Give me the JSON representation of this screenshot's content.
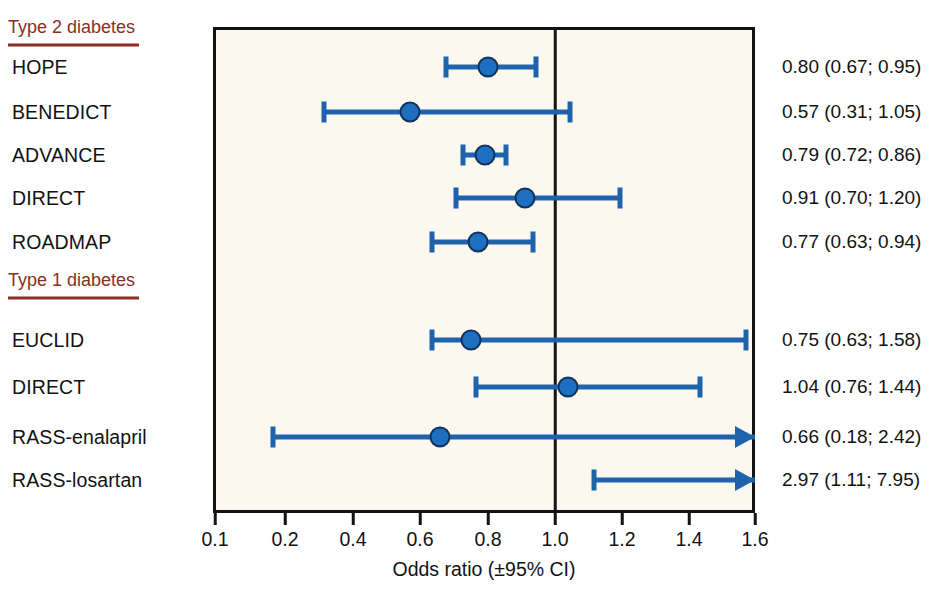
{
  "chart_data": {
    "type": "forest",
    "title": "",
    "xlabel": "Odds ratio (±95% CI)",
    "ylabel": "",
    "xlim": [
      0.1,
      1.6
    ],
    "reference_line": 1.0,
    "grid": false,
    "axis_note": "first segment 0.1 to 0.2 is compressed; remainder linear in 0.2 steps",
    "ticks": [
      {
        "value": 0.1,
        "label": "0.1",
        "px": 215
      },
      {
        "value": 0.2,
        "label": "0.2",
        "px": 285
      },
      {
        "value": 0.4,
        "label": "0.4",
        "px": 353
      },
      {
        "value": 0.6,
        "label": "0.6",
        "px": 420
      },
      {
        "value": 0.8,
        "label": "0.8",
        "px": 488
      },
      {
        "value": 1.0,
        "label": "1.0",
        "px": 555
      },
      {
        "value": 1.2,
        "label": "1.2",
        "px": 622
      },
      {
        "value": 1.4,
        "label": "1.4",
        "px": 689
      },
      {
        "value": 1.6,
        "label": "1.6",
        "px": 755
      }
    ],
    "sections": [
      {
        "label": "Type 2 diabetes",
        "y": 28,
        "rows": [
          {
            "study": "HOPE",
            "y": 67,
            "estimate": 0.8,
            "ci_low": 0.67,
            "ci_high": 0.95,
            "text": "0.80 (0.67; 0.95)",
            "arrow_right": false,
            "show_marker": true
          },
          {
            "study": "BENEDICT",
            "y": 112,
            "estimate": 0.57,
            "ci_low": 0.31,
            "ci_high": 1.05,
            "text": "0.57 (0.31; 1.05)",
            "arrow_right": false,
            "show_marker": true
          },
          {
            "study": "ADVANCE",
            "y": 155,
            "estimate": 0.79,
            "ci_low": 0.72,
            "ci_high": 0.86,
            "text": "0.79 (0.72; 0.86)",
            "arrow_right": false,
            "show_marker": true
          },
          {
            "study": "DIRECT",
            "y": 198,
            "estimate": 0.91,
            "ci_low": 0.7,
            "ci_high": 1.2,
            "text": "0.91 (0.70; 1.20)",
            "arrow_right": false,
            "show_marker": true
          },
          {
            "study": "ROADMAP",
            "y": 242,
            "estimate": 0.77,
            "ci_low": 0.63,
            "ci_high": 0.94,
            "text": "0.77 (0.63; 0.94)",
            "arrow_right": false,
            "show_marker": true
          }
        ]
      },
      {
        "label": "Type 1 diabetes",
        "y": 281,
        "rows": [
          {
            "study": "EUCLID",
            "y": 340,
            "estimate": 0.75,
            "ci_low": 0.63,
            "ci_high": 1.58,
            "text": "0.75 (0.63; 1.58)",
            "arrow_right": false,
            "show_marker": true
          },
          {
            "study": "DIRECT",
            "y": 387,
            "estimate": 1.04,
            "ci_low": 0.76,
            "ci_high": 1.44,
            "text": "1.04 (0.76; 1.44)",
            "arrow_right": false,
            "show_marker": true
          },
          {
            "study": "RASS-enalapril",
            "y": 437,
            "estimate": 0.66,
            "ci_low": 0.18,
            "ci_high": 2.42,
            "text": "0.66 (0.18; 2.42)",
            "arrow_right": true,
            "show_marker": true
          },
          {
            "study": "RASS-losartan",
            "y": 480,
            "estimate": 2.97,
            "ci_low": 1.11,
            "ci_high": 7.95,
            "text": "2.97 (1.11; 7.95)",
            "arrow_right": true,
            "show_marker": false
          }
        ]
      }
    ]
  },
  "colors": {
    "marker_fill": "#1f6fc0",
    "marker_edge": "#10335e",
    "ci_line": "#1f63ad",
    "section_header": "#8a2f26",
    "plot_background": "#fbf9ef",
    "frame": "#131313",
    "text": "#121212"
  }
}
